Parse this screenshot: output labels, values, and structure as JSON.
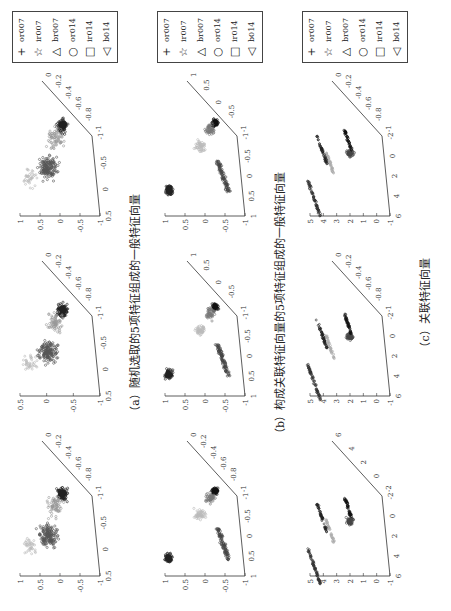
{
  "figure": {
    "rows": [
      {
        "id": "a",
        "caption": "（a）随机选取的5项特征组成的一般特征向量",
        "plots": [
          {
            "z_ticks": [
              "1",
              "0.5",
              "0",
              "-0.5",
              "-1"
            ],
            "x_ticks": [
              "0.5",
              "0",
              "-0.5",
              "-1"
            ],
            "y_ticks": [
              "-1",
              "-0.8",
              "-0.6",
              "-0.4",
              "-0.2",
              "0"
            ]
          },
          {
            "z_ticks": [
              "0.5",
              "0",
              "-0.5",
              "-1"
            ],
            "x_ticks": [
              "0.5",
              "0",
              "-0.5",
              "-1"
            ],
            "y_ticks": [
              "-1",
              "-0.8",
              "-0.6",
              "-0.4",
              "-0.2",
              "0"
            ]
          },
          {
            "z_ticks": [
              "1",
              "0.5",
              "0",
              "-0.5",
              "-1"
            ],
            "x_ticks": [
              "0.5",
              "0",
              "-0.5",
              "-1"
            ],
            "y_ticks": [
              "-1",
              "-0.8",
              "-0.6",
              "-0.4",
              "-0.2",
              "0"
            ]
          }
        ]
      },
      {
        "id": "b",
        "caption": "（b）构成关联特征向量的5项特征组成的一般特征向量",
        "plots": [
          {
            "z_ticks": [
              "1",
              "0.5",
              "0",
              "-0.5",
              "-1"
            ],
            "x_ticks": [
              "1",
              "0.5",
              "0",
              "-0.5",
              "-1"
            ],
            "y_ticks": [
              "-1",
              "-0.8",
              "-0.6",
              "-0.4",
              "-0.2",
              "0"
            ]
          },
          {
            "z_ticks": [
              "1",
              "0.5",
              "0",
              "-0.5",
              "-1"
            ],
            "x_ticks": [
              "1",
              "0.5",
              "0",
              "-0.5",
              "-1"
            ],
            "y_ticks": [
              "-1",
              "-0.5",
              "0",
              "0.5",
              "1"
            ]
          },
          {
            "z_ticks": [
              "1",
              "0.5",
              "0",
              "-0.5",
              "-1"
            ],
            "x_ticks": [
              "1",
              "0.5",
              "0",
              "-0.5",
              "-1"
            ],
            "y_ticks": [
              "-1",
              "-0.5",
              "0",
              "0.5",
              "1"
            ]
          }
        ]
      },
      {
        "id": "c",
        "caption": "（c）关联特征向量",
        "plots": [
          {
            "z_ticks": [
              "5",
              "4",
              "3",
              "2",
              "1",
              "0",
              "-1"
            ],
            "x_ticks": [
              "6",
              "4",
              "2",
              "0",
              "-2"
            ],
            "y_ticks": [
              "-2",
              "0",
              "2",
              "4",
              "6"
            ]
          },
          {
            "z_ticks": [
              "5",
              "4",
              "3",
              "2",
              "1",
              "0",
              "-1"
            ],
            "x_ticks": [
              "6",
              "4",
              "2",
              "0",
              "-2"
            ],
            "y_ticks": [
              "-1",
              "-0.8",
              "-0.6",
              "-0.4",
              "-0.2",
              "0"
            ]
          },
          {
            "z_ticks": [
              "5",
              "4",
              "3",
              "2",
              "1",
              "0",
              "-1"
            ],
            "x_ticks": [
              "6",
              "4",
              "2",
              "0",
              "-2"
            ],
            "y_ticks": [
              "-1",
              "-0.8",
              "-0.6",
              "-0.4",
              "-0.2",
              "0"
            ]
          }
        ]
      }
    ],
    "legend": [
      {
        "symbol": "+",
        "label": "or007"
      },
      {
        "symbol": "☆",
        "label": "ir007"
      },
      {
        "symbol": "△",
        "label": "br007"
      },
      {
        "symbol": "○",
        "label": "or014"
      },
      {
        "symbol": "□",
        "label": "ir014"
      },
      {
        "symbol": "◁",
        "label": "b014"
      }
    ]
  }
}
